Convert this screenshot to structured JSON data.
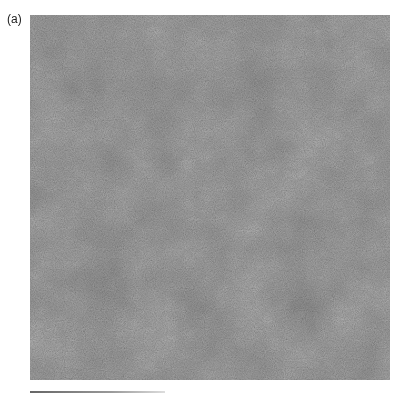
{
  "figure": {
    "panel_label": "(a)",
    "colors": {
      "texture_base": "#8a8a8a",
      "texture_dark": "#5e5e5e",
      "texture_light": "#b4b4b4",
      "background": "#ffffff"
    }
  }
}
